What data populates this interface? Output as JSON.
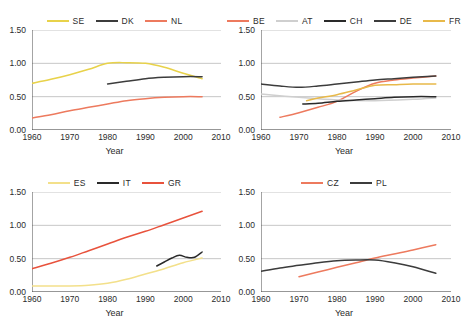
{
  "figure": {
    "panel_count": 4,
    "xlabel": "Year",
    "xticks": [
      "1960",
      "1970",
      "1980",
      "1990",
      "2000",
      "2010"
    ],
    "yticks": [
      "0.00",
      "0.50",
      "1.00",
      "1.50"
    ]
  },
  "colors": {
    "yellow": "#e8d24a",
    "pale_yellow": "#f3e08a",
    "light_yellow": "#f6d98f",
    "gold": "#e8b94a",
    "dark_gray": "#3c3c3c",
    "charcoal": "#2a2a2a",
    "salmon": "#ed7a5e",
    "red": "#e8523c",
    "light_gray": "#cfcfcf",
    "grid": "#b8b8b8",
    "axis": "#4a4a4a"
  },
  "chart_data": [
    {
      "type": "line",
      "panel": 1,
      "title": "",
      "xlabel": "Year",
      "ylabel": "",
      "xlim": [
        1960,
        2010
      ],
      "ylim": [
        0.0,
        1.5
      ],
      "xticks": [
        1960,
        1970,
        1980,
        1990,
        2000,
        2010
      ],
      "yticks": [
        0.0,
        0.5,
        1.0,
        1.5
      ],
      "grid": true,
      "legend_position": "top-center",
      "series": [
        {
          "name": "SE",
          "color": "#e8d24a",
          "x": [
            1960,
            1965,
            1970,
            1975,
            1980,
            1985,
            1990,
            1995,
            2000,
            2005
          ],
          "values": [
            0.7,
            0.76,
            0.83,
            0.91,
            1.0,
            1.01,
            1.0,
            0.94,
            0.85,
            0.77
          ]
        },
        {
          "name": "DK",
          "color": "#3c3c3c",
          "x": [
            1980,
            1985,
            1990,
            1995,
            2000,
            2005
          ],
          "values": [
            0.69,
            0.73,
            0.77,
            0.79,
            0.8,
            0.8
          ]
        },
        {
          "name": "NL",
          "color": "#ed7a5e",
          "x": [
            1960,
            1965,
            1970,
            1975,
            1980,
            1985,
            1990,
            1995,
            2000,
            2005
          ],
          "values": [
            0.18,
            0.23,
            0.29,
            0.34,
            0.39,
            0.44,
            0.47,
            0.49,
            0.5,
            0.5
          ]
        }
      ]
    },
    {
      "type": "line",
      "panel": 2,
      "title": "",
      "xlabel": "Year",
      "ylabel": "",
      "xlim": [
        1960,
        2010
      ],
      "ylim": [
        0.0,
        1.5
      ],
      "xticks": [
        1960,
        1970,
        1980,
        1990,
        2000,
        2010
      ],
      "yticks": [
        0.0,
        0.5,
        1.0,
        1.5
      ],
      "grid": true,
      "legend_position": "top-center",
      "series": [
        {
          "name": "BE",
          "color": "#ed7a5e",
          "x": [
            1965,
            1970,
            1975,
            1980,
            1985,
            1990,
            1995,
            2000,
            2006
          ],
          "values": [
            0.19,
            0.26,
            0.34,
            0.43,
            0.58,
            0.7,
            0.75,
            0.78,
            0.81
          ]
        },
        {
          "name": "AT",
          "color": "#cfcfcf",
          "x": [
            1960,
            1970,
            1980,
            1990,
            2000,
            2006
          ],
          "values": [
            0.54,
            0.49,
            0.45,
            0.44,
            0.46,
            0.48
          ]
        },
        {
          "name": "CH",
          "color": "#2a2a2a",
          "x": [
            1971,
            1975,
            1980,
            1985,
            1990,
            1995,
            2000,
            2006
          ],
          "values": [
            0.39,
            0.4,
            0.43,
            0.45,
            0.47,
            0.49,
            0.5,
            0.5
          ]
        },
        {
          "name": "DE",
          "color": "#3c3c3c",
          "x": [
            1960,
            1965,
            1970,
            1975,
            1980,
            1985,
            1990,
            1995,
            2000,
            2006
          ],
          "values": [
            0.69,
            0.66,
            0.64,
            0.66,
            0.69,
            0.72,
            0.75,
            0.77,
            0.79,
            0.81
          ]
        },
        {
          "name": "FR",
          "color": "#e8b94a",
          "x": [
            1972,
            1975,
            1980,
            1985,
            1990,
            1995,
            2000,
            2006
          ],
          "values": [
            0.44,
            0.48,
            0.53,
            0.6,
            0.67,
            0.68,
            0.69,
            0.69
          ]
        }
      ]
    },
    {
      "type": "line",
      "panel": 3,
      "title": "",
      "xlabel": "Year",
      "ylabel": "",
      "xlim": [
        1960,
        2010
      ],
      "ylim": [
        0.0,
        1.5
      ],
      "xticks": [
        1960,
        1970,
        1980,
        1990,
        2000,
        2010
      ],
      "yticks": [
        0.0,
        0.5,
        1.0,
        1.5
      ],
      "grid": true,
      "legend_position": "top-center",
      "series": [
        {
          "name": "ES",
          "color": "#f3e08a",
          "x": [
            1960,
            1965,
            1970,
            1975,
            1980,
            1985,
            1990,
            1995,
            2000,
            2005
          ],
          "values": [
            0.09,
            0.09,
            0.09,
            0.1,
            0.13,
            0.19,
            0.27,
            0.35,
            0.44,
            0.51
          ]
        },
        {
          "name": "IT",
          "color": "#2a2a2a",
          "x": [
            1993,
            1995,
            1997,
            1999,
            2001,
            2003,
            2005
          ],
          "values": [
            0.39,
            0.45,
            0.51,
            0.55,
            0.52,
            0.52,
            0.6
          ]
        },
        {
          "name": "GR",
          "color": "#e8523c",
          "x": [
            1960,
            1965,
            1970,
            1975,
            1980,
            1985,
            1990,
            1995,
            2000,
            2005
          ],
          "values": [
            0.35,
            0.43,
            0.52,
            0.62,
            0.72,
            0.82,
            0.91,
            1.01,
            1.11,
            1.21
          ]
        }
      ]
    },
    {
      "type": "line",
      "panel": 4,
      "title": "",
      "xlabel": "Year",
      "ylabel": "",
      "xlim": [
        1960,
        2010
      ],
      "ylim": [
        0.0,
        1.5
      ],
      "xticks": [
        1960,
        1970,
        1980,
        1990,
        2000,
        2010
      ],
      "yticks": [
        0.0,
        0.5,
        1.0,
        1.5
      ],
      "grid": true,
      "legend_position": "top-center",
      "series": [
        {
          "name": "CZ",
          "color": "#ed7a5e",
          "x": [
            1970,
            1975,
            1980,
            1985,
            1990,
            1995,
            2000,
            2006
          ],
          "values": [
            0.23,
            0.3,
            0.37,
            0.44,
            0.51,
            0.57,
            0.63,
            0.71
          ]
        },
        {
          "name": "PL",
          "color": "#3c3c3c",
          "x": [
            1960,
            1965,
            1970,
            1975,
            1980,
            1985,
            1990,
            1995,
            2000,
            2006
          ],
          "values": [
            0.31,
            0.36,
            0.4,
            0.44,
            0.47,
            0.48,
            0.48,
            0.44,
            0.38,
            0.28
          ]
        }
      ]
    }
  ]
}
